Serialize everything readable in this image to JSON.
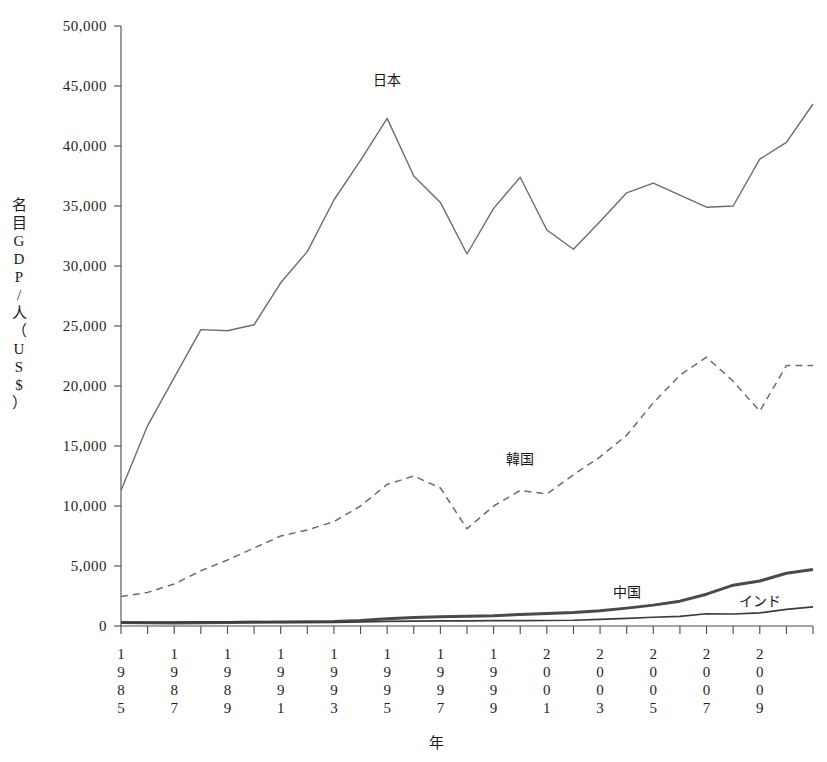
{
  "chart_data": {
    "type": "line",
    "title": "",
    "xlabel": "年",
    "ylabel": "名目GDP/人（US$）",
    "ylabel_chars": [
      "名",
      "目",
      "G",
      "D",
      "P",
      "/",
      "人",
      "（",
      "U",
      "S",
      "$",
      "）"
    ],
    "ylim": [
      0,
      50000
    ],
    "yticks": [
      0,
      5000,
      10000,
      15000,
      20000,
      25000,
      30000,
      35000,
      40000,
      45000,
      50000
    ],
    "ytick_labels": [
      "0",
      "5,000",
      "10,000",
      "15,000",
      "20,000",
      "25,000",
      "30,000",
      "35,000",
      "40,000",
      "45,000",
      "50,000"
    ],
    "grid": false,
    "legend_position": "inline-annotations",
    "x": [
      1985,
      1986,
      1987,
      1988,
      1989,
      1990,
      1991,
      1992,
      1993,
      1994,
      1995,
      1996,
      1997,
      1998,
      1999,
      2000,
      2001,
      2002,
      2003,
      2004,
      2005,
      2006,
      2007,
      2008,
      2009,
      2010,
      2011
    ],
    "xtick_labels": [
      "1985",
      "",
      "1987",
      "",
      "1989",
      "",
      "1991",
      "",
      "1993",
      "",
      "1995",
      "",
      "1997",
      "",
      "1999",
      "",
      "2001",
      "",
      "2003",
      "",
      "2005",
      "",
      "2007",
      "",
      "2009",
      "",
      ""
    ],
    "xtick_labels_shown": [
      "1985",
      "1987",
      "1989",
      "1991",
      "1993",
      "1995",
      "1997",
      "1999",
      "2001",
      "2003",
      "2005",
      "2007",
      "2009"
    ],
    "series": [
      {
        "name": "日本",
        "style": "solid-thin",
        "color": "#6d6d6d",
        "label_x": 1995,
        "label_y": 45100,
        "values": [
          11300,
          16700,
          20700,
          24700,
          24600,
          25100,
          28600,
          31200,
          35500,
          38800,
          42300,
          37500,
          35300,
          31000,
          34800,
          37400,
          33000,
          31400,
          33700,
          36100,
          36900,
          35900,
          34900,
          35000,
          38900,
          40300,
          43500
        ]
      },
      {
        "name": "韓国",
        "style": "dashed",
        "color": "#6d6d6d",
        "label_x": 2000,
        "label_y": 13500,
        "values": [
          2450,
          2800,
          3500,
          4600,
          5500,
          6500,
          7500,
          8000,
          8700,
          10000,
          11800,
          12500,
          11500,
          8100,
          10000,
          11300,
          11000,
          12600,
          14100,
          15900,
          18600,
          20900,
          22400,
          20400,
          17900,
          21700,
          21700
        ]
      },
      {
        "name": "中国",
        "style": "solid-thick",
        "color": "#4a4a4a",
        "label_x": 2004,
        "label_y": 2450,
        "values": [
          290,
          280,
          250,
          280,
          300,
          310,
          330,
          360,
          380,
          460,
          600,
          700,
          770,
          820,
          860,
          950,
          1040,
          1130,
          1270,
          1490,
          1740,
          2070,
          2650,
          3400,
          3750,
          4400,
          4700
        ]
      },
      {
        "name": "インド",
        "style": "solid-medium",
        "color": "#3c3c3c",
        "label_x": 2009,
        "label_y": 1700,
        "values": [
          290,
          300,
          330,
          350,
          340,
          370,
          300,
          310,
          300,
          340,
          380,
          410,
          420,
          420,
          450,
          450,
          460,
          480,
          560,
          640,
          730,
          810,
          1020,
          1000,
          1100,
          1380,
          1600
        ]
      }
    ]
  },
  "axis": {
    "y_title_text": "名目GDP／人（US$）",
    "x_title_text": "年"
  }
}
